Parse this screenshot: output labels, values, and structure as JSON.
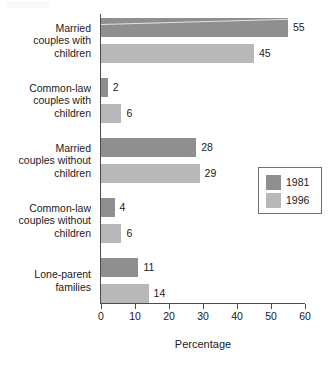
{
  "chart_data": {
    "type": "bar",
    "orientation": "horizontal",
    "title": "",
    "xlabel": "Percentage",
    "ylabel": "",
    "xlim": [
      0,
      60
    ],
    "xticks": [
      "0",
      "10",
      "20",
      "30",
      "40",
      "50",
      "60"
    ],
    "grid": false,
    "legend_position": "right",
    "categories": [
      "Married couples with children",
      "Common-law couples with children",
      "Married couples without children",
      "Common-law couples without children",
      "Lone-parent families"
    ],
    "category_lines": [
      [
        "Married",
        "couples with",
        "children"
      ],
      [
        "Common-law",
        "couples with",
        "children"
      ],
      [
        "Married",
        "couples without",
        "children"
      ],
      [
        "Common-law",
        "couples without",
        "children"
      ],
      [
        "Lone-parent",
        "families"
      ]
    ],
    "series": [
      {
        "name": "1981",
        "color": "#8f8f8f",
        "values": [
          55,
          2,
          28,
          4,
          11
        ]
      },
      {
        "name": "1996",
        "color": "#b8b8b8",
        "values": [
          45,
          6,
          29,
          6,
          14
        ]
      }
    ],
    "value_labels": [
      [
        "55",
        "45"
      ],
      [
        "2",
        "6"
      ],
      [
        "28",
        "29"
      ],
      [
        "4",
        "6"
      ],
      [
        "11",
        "14"
      ]
    ]
  },
  "legend": {
    "entries": [
      {
        "label": "1981",
        "color": "#8f8f8f"
      },
      {
        "label": "1996",
        "color": "#b8b8b8"
      }
    ]
  },
  "axis": {
    "x_title": "Percentage",
    "ticks": [
      "0",
      "10",
      "20",
      "30",
      "40",
      "50",
      "60"
    ]
  }
}
